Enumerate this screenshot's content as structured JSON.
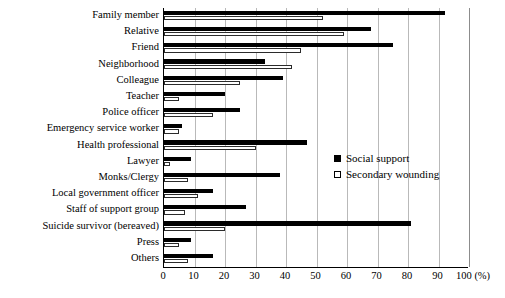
{
  "chart_data": {
    "type": "bar",
    "orientation": "horizontal",
    "title": "",
    "xlabel": "(%)",
    "ylabel": "",
    "xlim": [
      0,
      100
    ],
    "xticks": [
      0,
      10,
      20,
      30,
      40,
      50,
      60,
      70,
      80,
      90,
      100
    ],
    "xunit_label": "100 (%)",
    "grid": true,
    "legend_position": "middle-right",
    "categories": [
      "Family member",
      "Relative",
      "Friend",
      "Neighborhood",
      "Colleague",
      "Teacher",
      "Police officer",
      "Emergency service worker",
      "Health professional",
      "Lawyer",
      "Monks/Clergy",
      "Local government officer",
      "Staff of support group",
      "Suicide survivor (bereaved)",
      "Press",
      "Others"
    ],
    "series": [
      {
        "name": "Social support",
        "color": "#000000",
        "style": "filled",
        "values": [
          92,
          68,
          75,
          33,
          39,
          20,
          25,
          6,
          47,
          9,
          38,
          16,
          27,
          81,
          9,
          16
        ]
      },
      {
        "name": "Secondary wounding",
        "color": "#ffffff",
        "style": "hollow",
        "values": [
          52,
          59,
          45,
          42,
          25,
          5,
          16,
          5,
          30,
          2,
          8,
          11,
          7,
          20,
          5,
          8
        ]
      }
    ]
  },
  "legend": {
    "items": [
      {
        "label": "Social support",
        "swatch": "filled-square-icon"
      },
      {
        "label": "Secondary wounding",
        "swatch": "hollow-square-icon"
      }
    ]
  }
}
